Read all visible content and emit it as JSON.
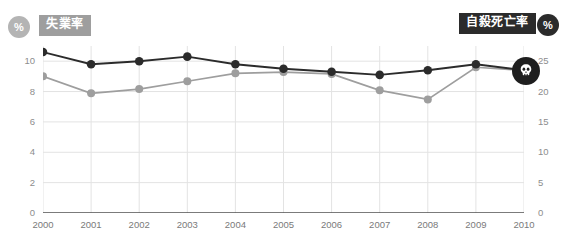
{
  "header": {
    "left_unit_icon": "percent-icon",
    "left_unit_text": "%",
    "left_series_label": "失業率",
    "right_series_label": "自殺死亡率",
    "right_unit_icon": "percent-icon",
    "right_unit_text": "%"
  },
  "colors": {
    "unemployment_line": "#2b2b2b",
    "suicide_line": "#9e9e9e",
    "left_badge_bg": "#9e9e9e",
    "right_badge_bg": "#2b2b2b",
    "grid": "#e3e3e3",
    "axis": "#5a5a5a",
    "tick_text": "#8d8d8d",
    "background": "#ffffff"
  },
  "marker": {
    "end_marker_icon": "skull-icon",
    "end_marker_year": "2010"
  },
  "chart_data": {
    "type": "line",
    "title": "",
    "xlabel": "",
    "ylabel": "%",
    "grid": true,
    "legend_position": "top",
    "categories": [
      "2000",
      "2001",
      "2002",
      "2003",
      "2004",
      "2005",
      "2006",
      "2007",
      "2008",
      "2009",
      "2010"
    ],
    "axes": {
      "left": {
        "label": "%",
        "ylim": [
          0,
          11
        ],
        "ticks": [
          "0",
          "2",
          "4",
          "6",
          "8",
          "10"
        ],
        "tick_values": [
          0,
          2,
          4,
          6,
          8,
          10
        ]
      },
      "right": {
        "label": "%",
        "ylim": [
          0,
          27.5
        ],
        "ticks": [
          "0",
          "5",
          "10",
          "15",
          "20",
          "25"
        ],
        "tick_values": [
          0,
          5,
          10,
          15,
          20,
          25
        ]
      }
    },
    "series": [
      {
        "name": "失業率",
        "axis": "left",
        "color": "#2b2b2b",
        "values": [
          10.6,
          9.8,
          10.0,
          10.3,
          9.8,
          9.5,
          9.3,
          9.1,
          9.4,
          9.8,
          9.4
        ]
      },
      {
        "name": "自殺死亡率",
        "axis": "right",
        "color": "#9e9e9e",
        "values": [
          22.5,
          19.7,
          20.4,
          21.7,
          23.0,
          23.2,
          22.9,
          20.2,
          18.7,
          24.0,
          23.5
        ]
      }
    ]
  }
}
